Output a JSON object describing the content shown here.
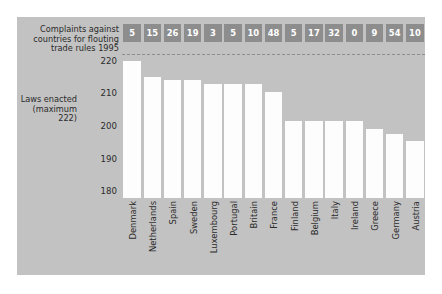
{
  "panel": {
    "background": "#c2c2c2",
    "bar_color": "#fdfdfd",
    "badge_color": "#8d8d8d",
    "text_color": "#2b2b2b"
  },
  "caption": "Complaints against countries for flouting trade rules 1995",
  "y_axis_title": "Laws enacted (maximum 222)",
  "chart_data": {
    "type": "bar",
    "title": "",
    "subtitle": "",
    "xlabel": "",
    "ylabel": "Laws enacted (maximum 222)",
    "ylim": [
      178,
      223
    ],
    "yticks": [
      220,
      210,
      200,
      190,
      180
    ],
    "grid": false,
    "legend": false,
    "annotations": [
      {
        "name": "maximum-line",
        "value": 222,
        "style": "dashed",
        "label": "maximum 222"
      }
    ],
    "categories": [
      "Denmark",
      "Netherlands",
      "Spain",
      "Sweden",
      "Luxembourg",
      "Portugal",
      "Britain",
      "France",
      "Finland",
      "Belgium",
      "Italy",
      "Ireland",
      "Greece",
      "Germany",
      "Austria"
    ],
    "series": [
      {
        "name": "Laws enacted (maximum 222)",
        "values": [
          220,
          215,
          214,
          214,
          213,
          213,
          213,
          210.5,
          201.5,
          201.5,
          201.5,
          201.5,
          199,
          197.5,
          195.5
        ]
      },
      {
        "name": "Complaints against countries for flouting trade rules 1995",
        "values": [
          5,
          15,
          26,
          19,
          3,
          5,
          10,
          48,
          5,
          17,
          32,
          0,
          9,
          54,
          10
        ]
      }
    ]
  }
}
